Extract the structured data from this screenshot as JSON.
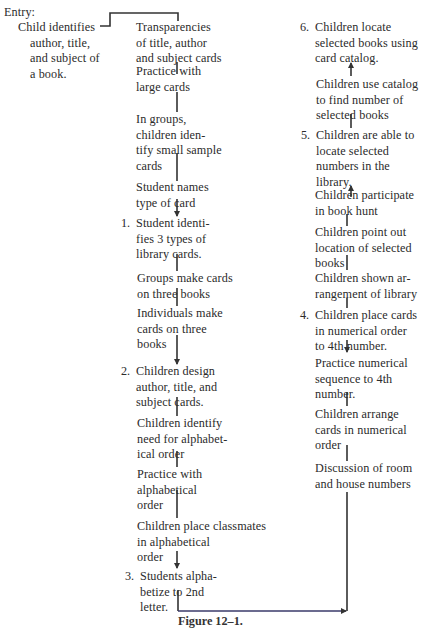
{
  "entry": {
    "label": "Entry:",
    "lines": [
      "Child identifies",
      "author, title,",
      "and subject of",
      "a book."
    ]
  },
  "middle_column": [
    {
      "id": "m1",
      "number": "",
      "lines": [
        "Transparencies",
        "of title, author",
        "and subject cards"
      ]
    },
    {
      "id": "m2",
      "number": "",
      "lines": [
        "Practice with",
        "large cards"
      ]
    },
    {
      "id": "m3",
      "number": "",
      "lines": [
        "In groups,",
        "children iden-",
        "tify small sample",
        "cards"
      ]
    },
    {
      "id": "m4",
      "number": "",
      "lines": [
        "Student names",
        "type of card"
      ]
    },
    {
      "id": "m5",
      "number": "1.",
      "lines": [
        "Student identi-",
        "fies 3 types of",
        "library cards."
      ]
    },
    {
      "id": "m6",
      "number": "",
      "lines": [
        "Groups make cards",
        "on three books"
      ]
    },
    {
      "id": "m7",
      "number": "",
      "lines": [
        "Individuals make",
        "cards on three",
        "books"
      ]
    },
    {
      "id": "m8",
      "number": "2.",
      "lines": [
        "Children design",
        "author, title, and",
        "subject cards."
      ]
    },
    {
      "id": "m9",
      "number": "",
      "lines": [
        "Children identify",
        "need for alphabet-",
        "ical order"
      ]
    },
    {
      "id": "m10",
      "number": "",
      "lines": [
        "Practice with",
        "alphabetical",
        "order"
      ]
    },
    {
      "id": "m11",
      "number": "",
      "lines": [
        "Children place classmates",
        "in alphabetical",
        "order"
      ]
    },
    {
      "id": "m12",
      "number": "3.",
      "lines": [
        "Students alpha-",
        "betize to 2nd",
        "letter."
      ]
    }
  ],
  "right_column": [
    {
      "id": "r1",
      "number": "6.",
      "lines": [
        "Children locate",
        "selected books using",
        "card catalog."
      ]
    },
    {
      "id": "r2",
      "number": "",
      "lines": [
        "Children use catalog",
        "to find number of",
        "selected books"
      ]
    },
    {
      "id": "r3",
      "number": "5.",
      "lines": [
        "Children are able to",
        "locate selected",
        "numbers in the",
        "library."
      ]
    },
    {
      "id": "r4",
      "number": "",
      "lines": [
        "Children participate",
        "in book hunt"
      ]
    },
    {
      "id": "r5",
      "number": "",
      "lines": [
        "Children point out",
        "location of selected",
        "books"
      ]
    },
    {
      "id": "r6",
      "number": "",
      "lines": [
        "Children shown ar-",
        "rangement of library"
      ]
    },
    {
      "id": "r7",
      "number": "4.",
      "lines": [
        "Children place cards",
        "in numerical order",
        "to 4th number."
      ]
    },
    {
      "id": "r8",
      "number": "",
      "lines": [
        "Practice numerical",
        "sequence to 4th",
        "number."
      ]
    },
    {
      "id": "r9",
      "number": "",
      "lines": [
        "Children arrange",
        "cards in numerical",
        "order"
      ]
    },
    {
      "id": "r10",
      "number": "",
      "lines": [
        "Discussion of room",
        "and house numbers"
      ]
    }
  ],
  "caption": "Figure 12–1.",
  "colors": {
    "text": "#2b2b2b",
    "line": "#333333",
    "bottom_connector": "#3a3a6a",
    "background": "#ffffff"
  }
}
